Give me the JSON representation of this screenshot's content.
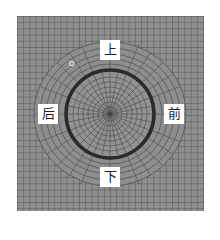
{
  "diagram": {
    "type": "finite-element-mesh",
    "colors": {
      "background": "#8f8f8f",
      "grid": "#3d3d3d",
      "ring": "#2a2a2a",
      "label_bg": "#ffffff"
    },
    "labels": {
      "top": "上",
      "bottom": "下",
      "front": "前",
      "back": "后"
    },
    "marker": "D"
  }
}
